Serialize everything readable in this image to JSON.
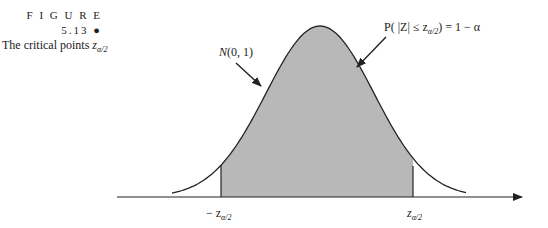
{
  "caption": {
    "figure_label": "F I G U R E 5.13 ●",
    "title_prefix": "The critical points ",
    "title_symbol": "z",
    "title_subscript": "α/2"
  },
  "annotations": {
    "distribution": "N(0, 1)",
    "probability_label": "P( |Z| ≤ z",
    "probability_sub": "α/2",
    "probability_rhs": ") = 1 − α",
    "left_tick_prefix": "− z",
    "left_tick_sub": "α/2",
    "right_tick": "z",
    "right_tick_sub": "α/2"
  },
  "colors": {
    "fill": "#b8b8b8",
    "stroke": "#222222"
  }
}
